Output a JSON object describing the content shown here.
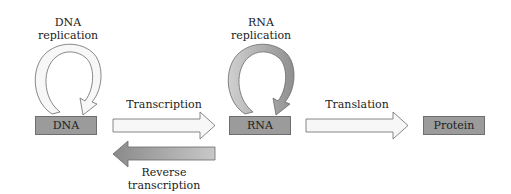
{
  "diagram": {
    "nodes": [
      {
        "id": "dna",
        "label": "DNA"
      },
      {
        "id": "rna",
        "label": "RNA"
      },
      {
        "id": "protein",
        "label": "Protein"
      }
    ],
    "processes": {
      "dna_replication": {
        "line1": "DNA",
        "line2": "replication"
      },
      "rna_replication": {
        "line1": "RNA",
        "line2": "replication"
      },
      "transcription": "Transcription",
      "reverse_transcription": {
        "line1": "Reverse",
        "line2": "transcription"
      },
      "translation": "Translation"
    },
    "colors": {
      "box_fill": "#9b9b9b",
      "box_border": "#6e6e6e",
      "light_arrow_fill": "#f7f7f7",
      "dark_arrow_fill": "#9a9a9a",
      "arrow_stroke": "#6a6a6a"
    }
  }
}
